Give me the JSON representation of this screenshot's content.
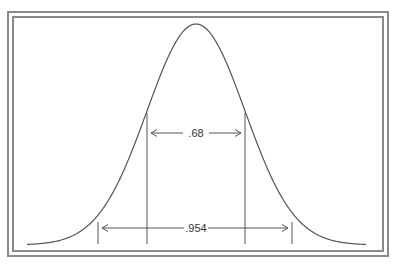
{
  "diagram": {
    "type": "normal-distribution",
    "curve_color": "#555555",
    "frame_color": "#8a8a8a",
    "intervals": [
      {
        "label": ".68",
        "range": "mean ± 1 sigma"
      },
      {
        "label": ".954",
        "range": "mean ± 2 sigma"
      }
    ]
  }
}
